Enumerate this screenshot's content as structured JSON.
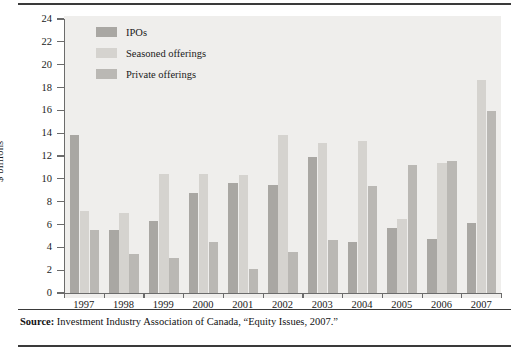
{
  "figure": {
    "axis_title": "$ billions",
    "source_label": "Source:",
    "source_text": " Investment Industry Association of Canada, “Equity Issues, 2007.”"
  },
  "legend": {
    "items": [
      {
        "label": "IPOs",
        "color": "#a9a7a3"
      },
      {
        "label": "Seasoned offerings",
        "color": "#d5d3cf"
      },
      {
        "label": "Private offerings",
        "color": "#bab8b4"
      }
    ]
  },
  "chart_data": {
    "type": "bar",
    "title": "",
    "subtitle": "",
    "xlabel": "",
    "ylabel": "$ billions",
    "ylim": [
      0,
      24
    ],
    "ytick_step": 2,
    "yticks": [
      0,
      2,
      4,
      6,
      8,
      10,
      12,
      14,
      16,
      18,
      20,
      22,
      24
    ],
    "ytick_labels": [
      "0",
      "2",
      "4",
      "6",
      "8",
      "10",
      "12",
      "14",
      "16",
      "18",
      "20",
      "22",
      "24"
    ],
    "grid": false,
    "legend_position": "top-left",
    "categories": [
      "1997",
      "1998",
      "1999",
      "2000",
      "2001",
      "2002",
      "2003",
      "2004",
      "2005",
      "2006",
      "2007"
    ],
    "series": [
      {
        "name": "IPOs",
        "color": "#a9a7a3",
        "values": [
          13.8,
          5.5,
          6.3,
          8.8,
          9.6,
          9.5,
          11.9,
          4.5,
          5.7,
          4.7,
          6.1
        ]
      },
      {
        "name": "Seasoned offerings",
        "color": "#d5d3cf",
        "values": [
          7.2,
          7.0,
          10.4,
          10.4,
          10.3,
          13.8,
          13.1,
          13.3,
          6.5,
          11.4,
          18.7
        ]
      },
      {
        "name": "Private offerings",
        "color": "#bab8b4",
        "values": [
          5.5,
          3.4,
          3.1,
          4.5,
          2.1,
          3.6,
          4.6,
          9.4,
          11.2,
          11.6,
          15.9
        ]
      }
    ]
  }
}
